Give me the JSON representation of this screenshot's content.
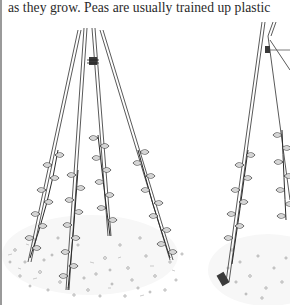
{
  "page": {
    "body_text": "as they grow. Peas are usually trained up plastic"
  },
  "illustration": {
    "subject": "two cane teepee supports with climbing pea plants in mulched soil",
    "figures": [
      {
        "label": "left-teepee",
        "description": "four bamboo canes tied at the top with twine, climbing plants on each cane, mulched soil circle"
      },
      {
        "label": "right-teepee",
        "description": "partially visible teepee of canes crossed and tied at the top, climbing plants, cane base in soil"
      }
    ],
    "colors": {
      "ink": "#2b2b2b",
      "cane": "#5a5a5a",
      "soil_dots": "#8a8a8a",
      "page": "#ffffff",
      "edge": "#9a9a9a"
    }
  }
}
